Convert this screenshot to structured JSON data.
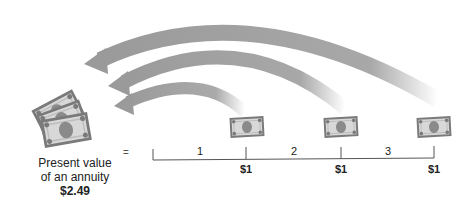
{
  "diagram": {
    "title": "Present value of an annuity",
    "present_value": {
      "label_line1": "Present value",
      "label_line2": "of an annuity",
      "value": "$2.49"
    },
    "equals_sign": "=",
    "periods": [
      "1",
      "2",
      "3"
    ],
    "payments": [
      "$1",
      "$1",
      "$1"
    ],
    "colors": {
      "arrow": "#9a9a9a",
      "bill_fill": "#d8d8d8",
      "bill_stroke": "#7a7a7a",
      "portrait": "#8a8a8a",
      "timeline": "#555555"
    }
  }
}
